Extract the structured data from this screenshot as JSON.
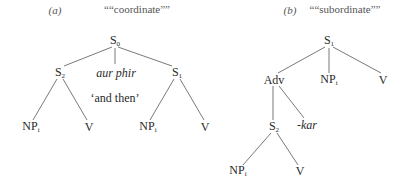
{
  "diagrams": [
    {
      "id": "a",
      "label_prefix": "(a)",
      "title": "““coordinate””",
      "nodes": {
        "root": {
          "base": "S",
          "sub": "0"
        },
        "left_s": {
          "base": "S",
          "sub": "2"
        },
        "connective": {
          "text": "aur phir"
        },
        "gloss": {
          "text": "‘and then’"
        },
        "right_s": {
          "base": "S",
          "sub": "1"
        },
        "np1": {
          "base": "NP",
          "sub": "i"
        },
        "v1": {
          "base": "V"
        },
        "np2": {
          "base": "NP",
          "sub": "i"
        },
        "v2": {
          "base": "V"
        }
      }
    },
    {
      "id": "b",
      "label_prefix": "(b)",
      "title": "““subordinate””",
      "nodes": {
        "root": {
          "base": "S",
          "sub": "1"
        },
        "adv": {
          "base": "Adv"
        },
        "np_top": {
          "base": "NP",
          "sub": "i"
        },
        "v_top": {
          "base": "V"
        },
        "sub_s": {
          "base": "S",
          "sub": "2"
        },
        "suffix": {
          "text": "-kar"
        },
        "np_bottom": {
          "base": "NP",
          "sub": "i"
        },
        "v_bottom": {
          "base": "V"
        }
      }
    }
  ],
  "colors": {
    "line": "#555555",
    "text": "#2a2a2a",
    "background": "#ffffff"
  }
}
